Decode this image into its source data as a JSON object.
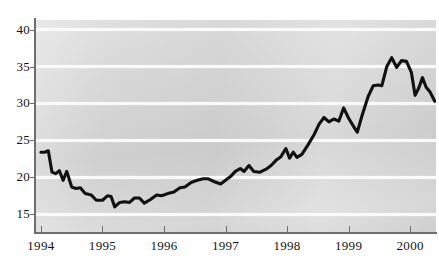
{
  "chart_data": {
    "type": "line",
    "title": "",
    "subtitle": "",
    "xlabel": "",
    "ylabel": "",
    "xlim": [
      1993.92,
      2000.42
    ],
    "ylim": [
      12.6,
      41.3
    ],
    "grid": true,
    "grid_axis": "y",
    "legend": "none",
    "series_color": "#111111",
    "panel_color": "#d7d7d7",
    "gridline_color": "#fafafa",
    "axis_color": "#6e6e6e",
    "y_ticks": [
      15,
      20,
      25,
      30,
      35,
      40
    ],
    "y_tick_labels": [
      "15",
      "20",
      "25",
      "30",
      "35",
      "40"
    ],
    "x_ticks": [
      1994,
      1995,
      1996,
      1997,
      1998,
      1999,
      2000
    ],
    "x_tick_labels": [
      "1994",
      "1995",
      "1996",
      "1997",
      "1998",
      "1999",
      "2000"
    ],
    "series": [
      {
        "name": "series-1",
        "x": [
          1994.0,
          1994.08,
          1994.17,
          1994.25,
          1994.33,
          1994.42,
          1994.5,
          1994.58,
          1994.67,
          1994.75,
          1994.83,
          1994.92,
          1995.0,
          1995.08,
          1995.17,
          1995.25,
          1995.33,
          1995.42,
          1995.5,
          1995.58,
          1995.67,
          1995.75,
          1995.83,
          1995.92,
          1996.0,
          1996.08,
          1996.17,
          1996.25,
          1996.33,
          1996.42,
          1996.5,
          1996.58,
          1996.67,
          1996.75,
          1996.83,
          1996.92,
          1997.0,
          1997.08,
          1997.17,
          1997.25,
          1997.33,
          1997.42,
          1997.5,
          1997.58,
          1997.67,
          1997.75,
          1997.83,
          1997.92,
          1998.0,
          1998.08,
          1998.17,
          1998.25,
          1998.33,
          1998.42,
          1998.5,
          1998.58,
          1998.67,
          1998.75,
          1998.83,
          1998.92,
          1999.0,
          1999.08,
          1999.17,
          1999.25,
          1999.33,
          1999.42,
          1999.5,
          1999.58,
          1999.67,
          1999.75,
          1999.83,
          1999.92,
          2000.0,
          2000.08,
          2000.17,
          2000.25,
          2000.33
        ],
        "values": [
          23.4,
          23.4,
          23.6,
          20.7,
          20.5,
          20.9,
          19.6,
          20.8,
          18.7,
          18.5,
          18.6,
          17.8,
          17.6,
          16.9,
          16.9,
          17.5,
          17.4,
          16.0,
          16.6,
          16.7,
          16.6,
          17.2,
          17.2,
          16.5,
          17.0,
          17.6,
          17.5,
          17.8,
          18.0,
          18.6,
          18.7,
          19.3,
          19.6,
          19.8,
          19.8,
          19.4,
          19.1,
          19.6,
          20.1,
          20.8,
          21.2,
          20.8,
          21.6,
          20.8,
          20.7,
          21.1,
          21.6,
          22.3,
          22.8,
          23.9,
          22.6,
          23.4,
          22.7,
          23.1,
          24.4,
          25.8,
          27.2,
          28.1,
          27.5,
          27.9,
          27.6,
          29.4,
          28.0,
          26.9,
          26.1,
          28.4,
          31.0,
          32.4,
          32.5,
          32.4,
          35.0,
          36.2,
          34.9,
          35.8,
          35.7,
          34.2,
          31.1
        ]
      },
      {
        "name": "series-1-tail",
        "x": [
          2000.0,
          2000.08,
          2000.17,
          2000.25,
          2000.33,
          2000.42
        ],
        "values": [
          31.1,
          32.1,
          33.5,
          32.2,
          31.6,
          30.3
        ]
      }
    ],
    "series_points": [
      [
        1994.0,
        23.4
      ],
      [
        1994.06,
        23.4
      ],
      [
        1994.12,
        23.6
      ],
      [
        1994.18,
        20.7
      ],
      [
        1994.24,
        20.5
      ],
      [
        1994.3,
        20.9
      ],
      [
        1994.36,
        19.6
      ],
      [
        1994.42,
        20.8
      ],
      [
        1994.5,
        18.7
      ],
      [
        1994.57,
        18.5
      ],
      [
        1994.64,
        18.6
      ],
      [
        1994.72,
        17.8
      ],
      [
        1994.82,
        17.6
      ],
      [
        1994.9,
        16.9
      ],
      [
        1995.0,
        16.9
      ],
      [
        1995.08,
        17.5
      ],
      [
        1995.14,
        17.4
      ],
      [
        1995.2,
        16.0
      ],
      [
        1995.28,
        16.6
      ],
      [
        1995.36,
        16.7
      ],
      [
        1995.44,
        16.6
      ],
      [
        1995.52,
        17.2
      ],
      [
        1995.6,
        17.2
      ],
      [
        1995.68,
        16.5
      ],
      [
        1995.78,
        17.0
      ],
      [
        1995.88,
        17.6
      ],
      [
        1995.96,
        17.5
      ],
      [
        1996.06,
        17.8
      ],
      [
        1996.16,
        18.0
      ],
      [
        1996.26,
        18.6
      ],
      [
        1996.34,
        18.7
      ],
      [
        1996.44,
        19.3
      ],
      [
        1996.54,
        19.6
      ],
      [
        1996.64,
        19.8
      ],
      [
        1996.72,
        19.8
      ],
      [
        1996.82,
        19.4
      ],
      [
        1996.92,
        19.1
      ],
      [
        1997.0,
        19.6
      ],
      [
        1997.08,
        20.1
      ],
      [
        1997.16,
        20.8
      ],
      [
        1997.24,
        21.2
      ],
      [
        1997.3,
        20.8
      ],
      [
        1997.38,
        21.6
      ],
      [
        1997.46,
        20.8
      ],
      [
        1997.56,
        20.7
      ],
      [
        1997.66,
        21.1
      ],
      [
        1997.74,
        21.6
      ],
      [
        1997.82,
        22.3
      ],
      [
        1997.9,
        22.8
      ],
      [
        1997.98,
        23.9
      ],
      [
        1998.04,
        22.6
      ],
      [
        1998.1,
        23.4
      ],
      [
        1998.16,
        22.7
      ],
      [
        1998.24,
        23.1
      ],
      [
        1998.34,
        24.4
      ],
      [
        1998.44,
        25.8
      ],
      [
        1998.52,
        27.2
      ],
      [
        1998.6,
        28.1
      ],
      [
        1998.68,
        27.5
      ],
      [
        1998.76,
        27.9
      ],
      [
        1998.84,
        27.6
      ],
      [
        1998.92,
        29.4
      ],
      [
        1999.0,
        28.0
      ],
      [
        1999.08,
        26.9
      ],
      [
        1999.14,
        26.1
      ],
      [
        1999.22,
        28.4
      ],
      [
        1999.32,
        31.0
      ],
      [
        1999.4,
        32.4
      ],
      [
        1999.48,
        32.5
      ],
      [
        1999.54,
        32.4
      ],
      [
        1999.62,
        35.0
      ],
      [
        1999.7,
        36.2
      ],
      [
        1999.78,
        34.9
      ],
      [
        1999.86,
        35.8
      ],
      [
        1999.94,
        35.7
      ],
      [
        2000.02,
        34.2
      ],
      [
        2000.08,
        31.1
      ],
      [
        2000.14,
        32.1
      ],
      [
        2000.2,
        33.5
      ],
      [
        2000.26,
        32.2
      ],
      [
        2000.32,
        31.6
      ],
      [
        2000.4,
        30.3
      ]
    ]
  }
}
